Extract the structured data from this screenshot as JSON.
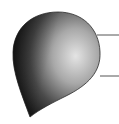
{
  "figure": {
    "colors": {
      "background": "#ffffff",
      "shape_dark": "#1e1e1e",
      "shape_mid": "#6a6a6a",
      "shape_light": "#d8d8d8",
      "leader_line": "#555555"
    },
    "leader_lines": [
      {
        "x1": 97,
        "y1": 35,
        "x2": 119,
        "y2": 35
      },
      {
        "x1": 100,
        "y1": 76,
        "x2": 119,
        "y2": 76
      }
    ]
  }
}
